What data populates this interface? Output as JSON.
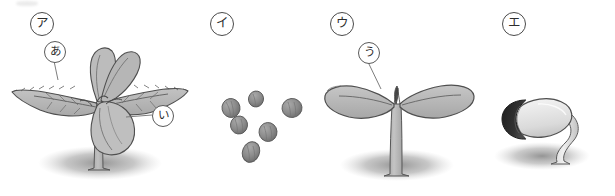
{
  "figure": {
    "title": "",
    "width": 615,
    "height": 196,
    "background_color": "#ffffff"
  },
  "palette": {
    "leaf_fill": "#b3b3b3",
    "leaf_fill_light": "#c4c4c4",
    "leaf_fill_dark": "#9e9e9e",
    "outline": "#4a4a4a",
    "stem_fill": "#a8a8a8",
    "seed_fill": "#8c8c8c",
    "seed_dark": "#2b2b2b",
    "seed_light": "#e8e8e8",
    "shadow": "#9a9a9a",
    "label_text": "#2d2d2d",
    "leader_line": "#6e6e6e"
  },
  "panels": [
    {
      "id": "panel-a",
      "stage_label": "ア",
      "stage_label_pos": {
        "x": 30,
        "y": 12
      },
      "subject": "young plant with true leaves and cotyledons",
      "part_labels": [
        {
          "id": "label-a-hiragana",
          "text": "あ",
          "pos": {
            "x": 44,
            "y": 41
          },
          "points_to": "serrated true leaf",
          "leader": {
            "x1": 54,
            "y1": 61,
            "x2": 58,
            "y2": 78
          }
        },
        {
          "id": "label-i-hiragana",
          "text": "い",
          "pos": {
            "x": 152,
            "y": 105
          },
          "points_to": "cotyledon",
          "leader": {
            "x1": 152,
            "y1": 115,
            "x2": 124,
            "y2": 116
          }
        }
      ]
    },
    {
      "id": "panel-b",
      "stage_label": "イ",
      "stage_label_pos": {
        "x": 210,
        "y": 12
      },
      "subject": "scattered seeds",
      "seed_count": 6,
      "part_labels": []
    },
    {
      "id": "panel-c",
      "stage_label": "ウ",
      "stage_label_pos": {
        "x": 330,
        "y": 12
      },
      "subject": "seedling with two cotyledons",
      "part_labels": [
        {
          "id": "label-u-hiragana",
          "text": "う",
          "pos": {
            "x": 362,
            "y": 42
          },
          "points_to": "cotyledon",
          "leader": {
            "x1": 368,
            "y1": 62,
            "x2": 380,
            "y2": 85
          }
        }
      ]
    },
    {
      "id": "panel-d",
      "stage_label": "エ",
      "stage_label_pos": {
        "x": 502,
        "y": 12
      },
      "subject": "germinating seed with emerging radicle",
      "part_labels": []
    }
  ]
}
